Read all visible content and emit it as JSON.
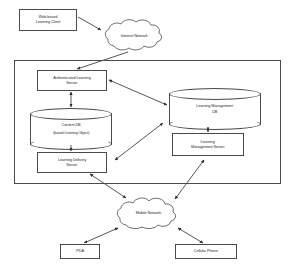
{
  "diagram": {
    "style": {
      "line_color": "#4a4a4a",
      "text_color": "#2b2b2b",
      "background": "#ffffff"
    },
    "nodes": {
      "client": {
        "label_line1": "Web-based",
        "label_line2": "Learning Client",
        "shape": "rectangle"
      },
      "internet_cloud": {
        "label": "Internet Network",
        "shape": "cloud"
      },
      "auth_server": {
        "label_line1": "Authenticated Learning",
        "label_line2": "Server",
        "shape": "rectangle"
      },
      "content_db": {
        "label_line1": "Content DB",
        "label_line2": "(based Learning Object)",
        "shape": "cylinder"
      },
      "delivery_server": {
        "label_line1": "Learning Delivery",
        "label_line2": "Server",
        "shape": "rectangle"
      },
      "lm_db": {
        "label_line1": "Learning Management",
        "label_line2": "DB",
        "shape": "cylinder"
      },
      "lm_server": {
        "label_line1": "Learning",
        "label_line2": "Management Server",
        "shape": "rectangle"
      },
      "mobile_cloud": {
        "label": "Mobile Network",
        "shape": "cloud"
      },
      "pda": {
        "label": "PDA",
        "shape": "rectangle"
      },
      "cellular_phone": {
        "label": "Cellular Phone",
        "shape": "rectangle"
      }
    },
    "frame": {
      "label": "server-system-boundary"
    },
    "connections": [
      {
        "from": "client",
        "to": "internet_cloud",
        "arrow": "single"
      },
      {
        "from": "internet_cloud",
        "to": "auth_server",
        "arrow": "single"
      },
      {
        "from": "auth_server",
        "to": "content_db",
        "arrow": "double"
      },
      {
        "from": "content_db",
        "to": "delivery_server",
        "arrow": "double"
      },
      {
        "from": "auth_server",
        "to": "lm_db",
        "arrow": "double"
      },
      {
        "from": "lm_db",
        "to": "lm_server",
        "arrow": "double"
      },
      {
        "from": "delivery_server",
        "to": "lm_db",
        "arrow": "double"
      },
      {
        "from": "delivery_server",
        "to": "mobile_cloud",
        "arrow": "double"
      },
      {
        "from": "lm_server",
        "to": "mobile_cloud",
        "arrow": "double"
      },
      {
        "from": "mobile_cloud",
        "to": "pda",
        "arrow": "double"
      },
      {
        "from": "mobile_cloud",
        "to": "cellular_phone",
        "arrow": "double"
      }
    ]
  }
}
